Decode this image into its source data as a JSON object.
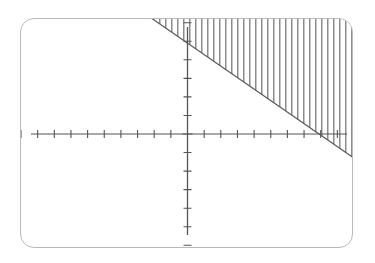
{
  "screen": {
    "device_label": "graphing-calculator-screen",
    "frame_color": "#b9b9b9",
    "background_color": "#ffffff",
    "width_px": 333,
    "height_px": 230
  },
  "chart_data": {
    "type": "line",
    "title": "",
    "subtitle": "",
    "xlabel": "",
    "ylabel": "",
    "grid": false,
    "legend": null,
    "axis_color": "#555555",
    "curve_color": "#5a5a5a",
    "shading_color": "#8c8c8c",
    "shading_style": "vertical-hatch",
    "shading_side": "above",
    "hatch_spacing_px": 6,
    "xlim": [
      -10,
      10
    ],
    "ylim": [
      -6.2,
      6.2
    ],
    "x_tick_step": 1,
    "y_tick_step": 1,
    "x_axis_y_value": 0,
    "y_axis_x_value": 0,
    "series": [
      {
        "name": "boundary-line",
        "kind": "line",
        "equation": "y = -0.62x + 4.9",
        "slope": -0.62,
        "intercept": 4.9,
        "x_intercept": 7.9,
        "style": "solid",
        "points": [
          {
            "x": -10,
            "y": 11.1
          },
          {
            "x": -8.2,
            "y": 10.0
          },
          {
            "x": 0,
            "y": 4.9
          },
          {
            "x": 7.9,
            "y": 0.0
          },
          {
            "x": 10,
            "y": -1.3
          }
        ]
      }
    ],
    "annotations": [
      {
        "name": "shaded-region",
        "text": "region above the boundary line is shaded with vertical lines"
      }
    ]
  }
}
